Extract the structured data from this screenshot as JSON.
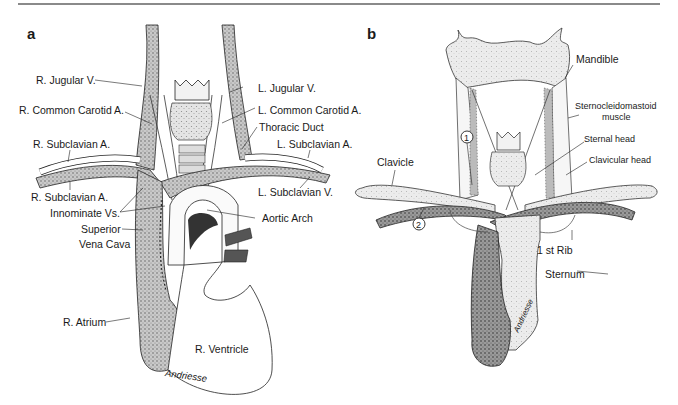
{
  "figure": {
    "rule_color": "#8a8a8a",
    "stipple_color": "#9a9a9a",
    "line_color": "#222222"
  },
  "panel_a": {
    "letter": "a",
    "labels": {
      "r_jugular": "R. Jugular V.",
      "l_jugular": "L. Jugular V.",
      "r_common_carotid": "R. Common Carotid A.",
      "l_common_carotid": "L. Common Carotid A.",
      "thoracic_duct": "Thoracic Duct",
      "r_subclavian_a": "R. Subclavian A.",
      "l_subclavian_a": "L. Subclavian A.",
      "r_subclavian_v": "R. Subclavian A.",
      "l_subclavian_v": "L. Subclavian V.",
      "innominate": "Innominate Vs.",
      "svc_1": "Superior",
      "svc_2": "Vena Cava",
      "aortic_arch": "Aortic Arch",
      "r_atrium": "R. Atrium",
      "r_ventricle": "R. Ventricle"
    },
    "signature": "Andriesse"
  },
  "panel_b": {
    "letter": "b",
    "labels": {
      "mandible": "Mandible",
      "scm_1": "Sternocleidomastoid",
      "scm_2": "muscle",
      "sternal_head": "Sternal head",
      "clavicular_head": "Clavicular head",
      "clavicle": "Clavicle",
      "first_rib": "1 st Rib",
      "sternum": "Sternum",
      "marker_1": "1",
      "marker_2": "2"
    },
    "signature": "Andriesse"
  }
}
